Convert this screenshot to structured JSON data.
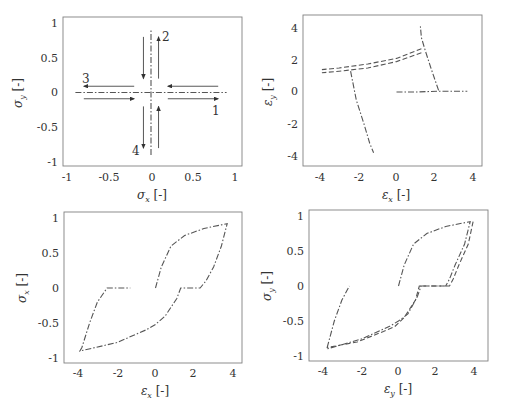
{
  "chart_data": [
    {
      "type": "line",
      "title": "",
      "xlabel": "σ_x [-]",
      "ylabel": "σ_y [-]",
      "xlim": [
        -1.05,
        1.1
      ],
      "ylim": [
        -1.05,
        1.05
      ],
      "xticks": [
        "-1",
        "-0.5",
        "0",
        "0.5",
        "1"
      ],
      "yticks": [
        "-1",
        "-0.5",
        "0",
        "0.5",
        "1"
      ],
      "grid": false,
      "series": [
        {
          "name": "uniaxial x loading",
          "style": "dash-dot",
          "x": [
            -0.9,
            0.9
          ],
          "y": [
            0.0,
            0.0
          ]
        },
        {
          "name": "uniaxial y loading",
          "style": "dash-dot",
          "x": [
            0.0,
            0.0
          ],
          "y": [
            -0.9,
            0.9
          ]
        }
      ],
      "annotations": [
        {
          "text": "1",
          "x": 0.85,
          "y": -0.22,
          "arrow": {
            "from": [
              0.2,
              -0.09
            ],
            "to": [
              0.8,
              -0.09
            ]
          }
        },
        {
          "text": "2",
          "x": 0.18,
          "y": 0.78,
          "arrow": {
            "from": [
              0.09,
              0.2
            ],
            "to": [
              0.09,
              0.8
            ]
          }
        },
        {
          "text": "3",
          "x": -0.85,
          "y": 0.16,
          "arrow": {
            "from": [
              -0.2,
              0.09
            ],
            "to": [
              -0.8,
              0.09
            ]
          }
        },
        {
          "text": "4",
          "x": -0.18,
          "y": -0.78,
          "arrow": {
            "from": [
              -0.09,
              -0.2
            ],
            "to": [
              -0.09,
              -0.8
            ]
          }
        },
        {
          "text": "",
          "x": 0,
          "y": 0,
          "arrow": {
            "from": [
              0.8,
              0.09
            ],
            "to": [
              0.2,
              0.09
            ]
          }
        },
        {
          "text": "",
          "x": 0,
          "y": 0,
          "arrow": {
            "from": [
              -0.8,
              -0.09
            ],
            "to": [
              -0.2,
              -0.09
            ]
          }
        },
        {
          "text": "",
          "x": 0,
          "y": 0,
          "arrow": {
            "from": [
              -0.09,
              0.8
            ],
            "to": [
              -0.09,
              0.2
            ]
          }
        },
        {
          "text": "",
          "x": 0,
          "y": 0,
          "arrow": {
            "from": [
              0.09,
              -0.8
            ],
            "to": [
              0.09,
              -0.2
            ]
          }
        }
      ]
    },
    {
      "type": "line",
      "title": "",
      "xlabel": "ε_x [-]",
      "ylabel": "ε_y [-]",
      "xlim": [
        -4.5,
        4.5
      ],
      "ylim": [
        -4.6,
        4.8
      ],
      "xticks": [
        "-4",
        "-2",
        "0",
        "2",
        "4"
      ],
      "yticks": [
        "-4",
        "-2",
        "0",
        "2",
        "4"
      ],
      "grid": false,
      "series": [
        {
          "name": "path 1",
          "style": "dash-dot",
          "x": [
            0.0,
            1.0,
            2.2,
            3.7
          ],
          "y": [
            0.0,
            0.0,
            0.05,
            0.05
          ]
        },
        {
          "name": "path 2",
          "style": "dash-dot",
          "x": [
            2.2,
            1.8,
            1.5,
            1.3,
            1.25
          ],
          "y": [
            0.1,
            1.5,
            2.6,
            3.4,
            4.1
          ]
        },
        {
          "name": "path 3",
          "style": "dashed",
          "x": [
            1.3,
            0.0,
            -1.5,
            -3.0,
            -3.9
          ],
          "y": [
            2.7,
            2.1,
            1.75,
            1.5,
            1.4
          ]
        },
        {
          "name": "path 3b",
          "style": "dashed",
          "x": [
            1.3,
            0.0,
            -1.5,
            -3.0,
            -3.9
          ],
          "y": [
            2.45,
            1.9,
            1.5,
            1.3,
            1.2
          ]
        },
        {
          "name": "path 4",
          "style": "dash-dot",
          "x": [
            -2.4,
            -2.1,
            -1.7,
            -1.4,
            -1.2
          ],
          "y": [
            1.3,
            -0.5,
            -2.0,
            -3.2,
            -3.8
          ]
        }
      ]
    },
    {
      "type": "line",
      "title": "",
      "xlabel": "ε_x [-]",
      "ylabel": "σ_x [-]",
      "xlim": [
        -4.5,
        4.5
      ],
      "ylim": [
        -1.1,
        1.05
      ],
      "xticks": [
        "-4",
        "-2",
        "0",
        "2",
        "4"
      ],
      "yticks": [
        "-1",
        "-0.5",
        "0",
        "0.5",
        "1"
      ],
      "grid": false,
      "series": [
        {
          "name": "loop",
          "style": "dash-dot",
          "x": [
            0.0,
            0.3,
            0.8,
            1.5,
            2.5,
            3.7,
            3.4,
            3.0,
            2.6,
            2.3,
            1.3,
            1.1,
            0.5,
            0.0,
            -0.5,
            -2.0,
            -3.9,
            -3.8,
            -3.4,
            -3.0,
            -2.5,
            -1.3
          ],
          "y": [
            0.0,
            0.3,
            0.6,
            0.75,
            0.85,
            0.92,
            0.6,
            0.3,
            0.1,
            0.0,
            0.0,
            -0.15,
            -0.4,
            -0.52,
            -0.6,
            -0.78,
            -0.9,
            -0.85,
            -0.5,
            -0.2,
            0.0,
            0.0
          ]
        }
      ]
    },
    {
      "type": "line",
      "title": "",
      "xlabel": "ε_y [-]",
      "ylabel": "σ_y [-]",
      "xlim": [
        -4.6,
        4.7
      ],
      "ylim": [
        -1.1,
        1.05
      ],
      "xticks": [
        "-4",
        "-2",
        "0",
        "2",
        "4"
      ],
      "yticks": [
        "-1",
        "-0.5",
        "0",
        "0.5",
        "1"
      ],
      "grid": false,
      "series": [
        {
          "name": "loop a",
          "style": "dash-dot",
          "x": [
            0.0,
            0.3,
            0.8,
            1.5,
            2.5,
            3.8,
            3.5,
            3.0,
            2.7,
            2.5,
            1.2,
            1.0,
            0.5,
            0.0,
            -0.5,
            -2.0,
            -3.8,
            -3.75,
            -3.4,
            -3.0,
            -2.6
          ],
          "y": [
            0.0,
            0.3,
            0.6,
            0.75,
            0.85,
            0.92,
            0.6,
            0.3,
            0.1,
            0.0,
            0.0,
            -0.15,
            -0.4,
            -0.5,
            -0.58,
            -0.76,
            -0.9,
            -0.85,
            -0.5,
            -0.2,
            0.0
          ]
        },
        {
          "name": "loop b",
          "style": "dashed",
          "x": [
            3.95,
            3.7,
            3.2,
            2.9,
            2.7,
            1.1,
            0.9,
            0.3,
            -0.2,
            -0.8,
            -2.2,
            -3.8
          ],
          "y": [
            0.92,
            0.6,
            0.3,
            0.1,
            0.0,
            0.0,
            -0.2,
            -0.45,
            -0.58,
            -0.65,
            -0.8,
            -0.88
          ]
        }
      ]
    }
  ],
  "panels": [
    {
      "xlabel_sym": "σ",
      "xlabel_sub": "x",
      "ylabel_sym": "σ",
      "ylabel_sub": "y",
      "unit": "[-]"
    },
    {
      "xlabel_sym": "ε",
      "xlabel_sub": "x",
      "ylabel_sym": "ε",
      "ylabel_sub": "y",
      "unit": "[-]"
    },
    {
      "xlabel_sym": "ε",
      "xlabel_sub": "x",
      "ylabel_sym": "σ",
      "ylabel_sub": "x",
      "unit": "[-]"
    },
    {
      "xlabel_sym": "ε",
      "xlabel_sub": "y",
      "ylabel_sym": "σ",
      "ylabel_sub": "y",
      "unit": "[-]"
    }
  ],
  "annotations_p1": {
    "n1": "1",
    "n2": "2",
    "n3": "3",
    "n4": "4"
  }
}
